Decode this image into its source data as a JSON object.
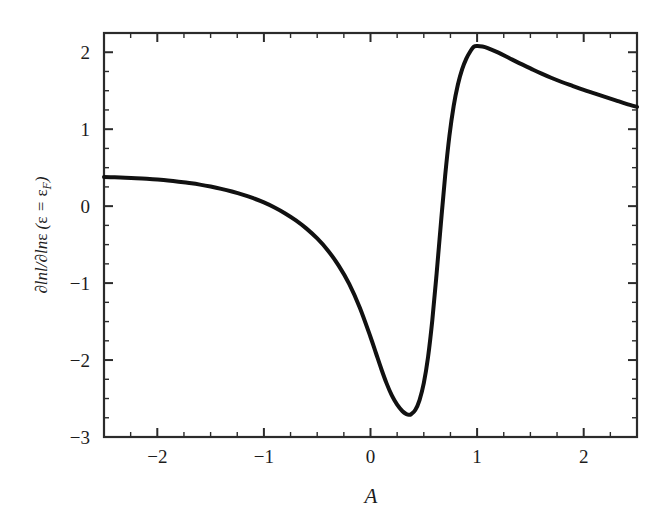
{
  "chart_data": {
    "type": "line",
    "title": "",
    "subtitle": "",
    "xlabel": "A",
    "ylabel": "∂lnl/∂lnε (ε = εF)",
    "ylabel_parts": {
      "numerator": "∂lnl",
      "denominator": "∂lnε",
      "condition": "(ε = εF)",
      "subscript": "F"
    },
    "xlim": [
      -2.5,
      2.5
    ],
    "ylim": [
      -3,
      2.25
    ],
    "xticks": [
      -2,
      -1,
      0,
      1,
      2
    ],
    "xtick_labels": [
      "−2",
      "−1",
      "0",
      "1",
      "2"
    ],
    "yticks": [
      -3,
      -2,
      -1,
      0,
      1,
      2
    ],
    "ytick_labels": [
      "−3",
      "−2",
      "−1",
      "0",
      "1",
      "2"
    ],
    "x_minor_ticks": [
      -2.5,
      -2.25,
      -1.75,
      -1.5,
      -1.25,
      -0.75,
      -0.5,
      -0.25,
      0.25,
      0.5,
      0.75,
      1.25,
      1.5,
      1.75,
      2.25,
      2.5
    ],
    "y_minor_ticks": [
      -2.75,
      -2.5,
      -2.25,
      -1.75,
      -1.5,
      -1.25,
      -0.75,
      -0.5,
      -0.25,
      0.25,
      0.5,
      0.75,
      1.25,
      1.5,
      1.75,
      2.25
    ],
    "grid": false,
    "legend": null,
    "legend_position": "none",
    "line_color": "#111111",
    "frame_color": "#2b2b2b",
    "background_color": "#ffffff",
    "annotations": [],
    "features": {
      "minimum": {
        "x": 0.36,
        "y": -2.71
      },
      "maximum": {
        "x": 0.97,
        "y": 2.09
      },
      "left_endpoint": {
        "x": -2.5,
        "y": 0.38
      },
      "right_endpoint": {
        "x": 2.5,
        "y": 1.21
      }
    },
    "x": [
      -2.5,
      -2.4,
      -2.3,
      -2.2,
      -2.1,
      -2.0,
      -1.9,
      -1.8,
      -1.7,
      -1.6,
      -1.5,
      -1.4,
      -1.3,
      -1.2,
      -1.1,
      -1.0,
      -0.9,
      -0.8,
      -0.7,
      -0.6,
      -0.5,
      -0.4,
      -0.3,
      -0.2,
      -0.1,
      0.0,
      0.05,
      0.1,
      0.15,
      0.2,
      0.25,
      0.3,
      0.34,
      0.36,
      0.38,
      0.42,
      0.46,
      0.5,
      0.54,
      0.58,
      0.62,
      0.66,
      0.7,
      0.74,
      0.78,
      0.82,
      0.86,
      0.9,
      0.94,
      0.97,
      1.0,
      1.05,
      1.1,
      1.2,
      1.3,
      1.4,
      1.5,
      1.6,
      1.7,
      1.8,
      1.9,
      2.0,
      2.1,
      2.2,
      2.3,
      2.4,
      2.5
    ],
    "y": [
      0.38,
      0.375,
      0.37,
      0.363,
      0.355,
      0.345,
      0.333,
      0.318,
      0.3,
      0.28,
      0.255,
      0.225,
      0.19,
      0.15,
      0.103,
      0.048,
      -0.018,
      -0.095,
      -0.185,
      -0.292,
      -0.42,
      -0.575,
      -0.77,
      -1.01,
      -1.32,
      -1.7,
      -1.905,
      -2.11,
      -2.3,
      -2.46,
      -2.58,
      -2.665,
      -2.705,
      -2.712,
      -2.705,
      -2.65,
      -2.52,
      -2.3,
      -1.96,
      -1.48,
      -0.88,
      -0.23,
      0.39,
      0.91,
      1.3,
      1.58,
      1.78,
      1.92,
      2.02,
      2.072,
      2.082,
      2.075,
      2.055,
      1.995,
      1.925,
      1.855,
      1.79,
      1.725,
      1.665,
      1.61,
      1.56,
      1.51,
      1.465,
      1.42,
      1.375,
      1.33,
      1.29
    ]
  },
  "geometry": {
    "plot_left": 104,
    "plot_right": 637,
    "plot_top": 33,
    "plot_bottom": 437
  }
}
